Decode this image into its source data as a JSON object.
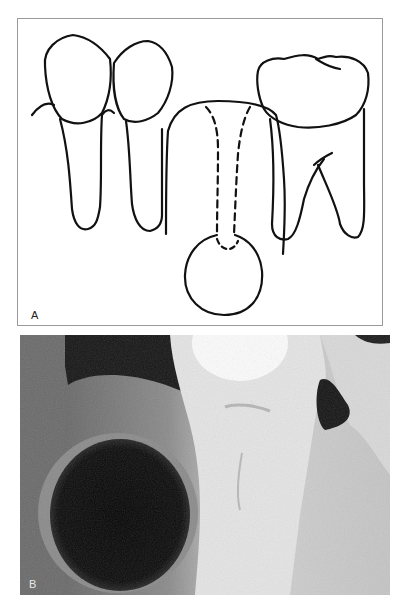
{
  "figure": {
    "panels": [
      {
        "id": "A",
        "label": "A",
        "kind": "line-drawing",
        "description": "Schematic of teeth with a round cyst below an unerupted/deciduous tooth; dashed lines indicate resorbed roots"
      },
      {
        "id": "B",
        "label": "B",
        "kind": "radiograph",
        "description": "Radiograph showing a round radiolucent lesion adjacent to a molar root"
      }
    ]
  }
}
